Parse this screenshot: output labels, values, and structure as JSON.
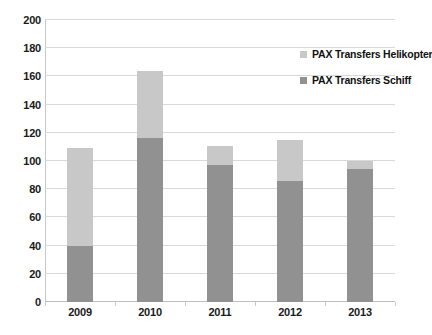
{
  "chart_data": {
    "type": "bar",
    "subtype": "stacked-bar",
    "title": "",
    "xlabel": "",
    "ylabel": "",
    "categories": [
      "2009",
      "2010",
      "2011",
      "2012",
      "2013"
    ],
    "series": [
      {
        "name": "PAX Transfers Schiff",
        "color": "#919191",
        "values": [
          40,
          116,
          97,
          86,
          94
        ]
      },
      {
        "name": "PAX Transfers Helikopter",
        "color": "#c8c8c8",
        "values": [
          69,
          48,
          14,
          29,
          6
        ]
      }
    ],
    "stack_order_bottom_to_top": [
      "PAX Transfers Schiff",
      "PAX Transfers Helikopter"
    ],
    "totals": [
      109,
      164,
      111,
      115,
      100
    ],
    "ylim": [
      0,
      200
    ],
    "ytick_step": 20,
    "yticks": [
      0,
      20,
      40,
      60,
      80,
      100,
      120,
      140,
      160,
      180,
      200
    ],
    "ytick_labels": [
      "0",
      "20",
      "40",
      "60",
      "80",
      "100",
      "120",
      "140",
      "160",
      "180",
      "200"
    ],
    "grid": "horizontal",
    "legend_position": "top-right-inside",
    "legend_entries": [
      {
        "label": "PAX Transfers Helikopter",
        "color": "#c8c8c8"
      },
      {
        "label": "PAX Transfers Schiff",
        "color": "#919191"
      }
    ],
    "background_color": "#ffffff",
    "gridline_color": "#d9d9d9"
  }
}
